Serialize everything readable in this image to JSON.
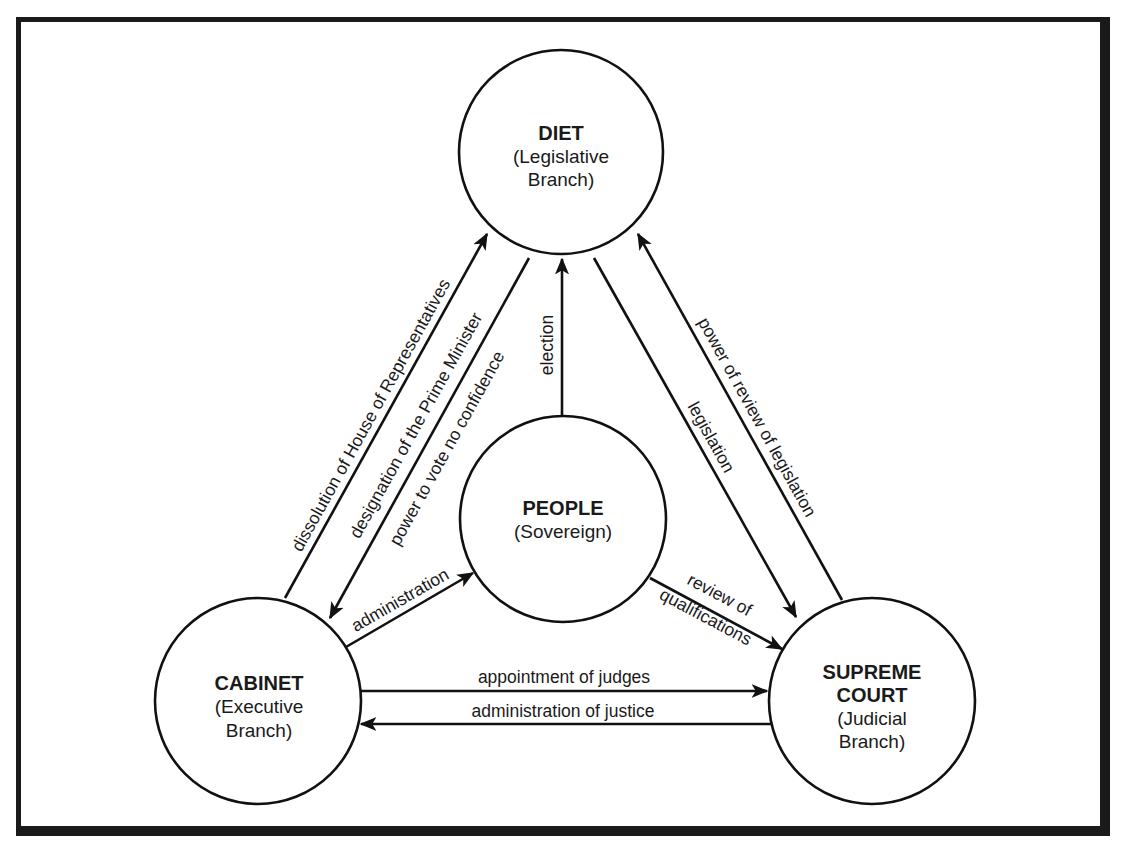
{
  "nodes": {
    "diet": {
      "title": "DIET",
      "sub1": "(Legislative",
      "sub2": "Branch)"
    },
    "people": {
      "title": "PEOPLE",
      "sub1": "(Sovereign)"
    },
    "cabinet": {
      "title": "CABINET",
      "sub1": "(Executive",
      "sub2": "Branch)"
    },
    "court": {
      "title1": "SUPREME",
      "title2": "COURT",
      "sub1": "(Judicial",
      "sub2": "Branch)"
    }
  },
  "edges": {
    "dissolution": {
      "from": "cabinet",
      "to": "diet",
      "label": "dissolution of House of Representatives"
    },
    "designation": {
      "from": "diet",
      "to": "cabinet",
      "label": "designation of the Prime Minister",
      "label2": "power to vote no confidence"
    },
    "election": {
      "from": "people",
      "to": "diet",
      "label": "election"
    },
    "legislation": {
      "from": "diet",
      "to": "court",
      "label": "legislation"
    },
    "review_legislation": {
      "from": "court",
      "to": "diet",
      "label": "power of review of legislation"
    },
    "administration": {
      "from": "cabinet",
      "to": "people",
      "label": "administration"
    },
    "review_qualifications": {
      "from": "people",
      "to": "court",
      "label1": "review of",
      "label2": "qualifications"
    },
    "appointment": {
      "from": "cabinet",
      "to": "court",
      "label": "appointment of judges"
    },
    "justice": {
      "from": "court",
      "to": "cabinet",
      "label": "administration of justice"
    }
  }
}
